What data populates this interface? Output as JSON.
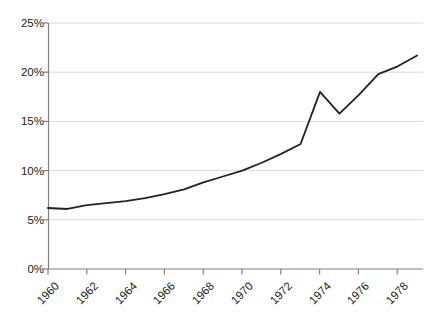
{
  "chart_data": {
    "type": "line",
    "title": "",
    "subtitle": "",
    "xlabel": "",
    "ylabel": "",
    "x": [
      1960,
      1961,
      1962,
      1963,
      1964,
      1965,
      1966,
      1967,
      1968,
      1969,
      1970,
      1971,
      1972,
      1973,
      1974,
      1975,
      1976,
      1977,
      1978,
      1979
    ],
    "values": [
      6.2,
      6.1,
      6.5,
      6.7,
      6.9,
      7.2,
      7.6,
      8.1,
      8.8,
      9.4,
      10.0,
      10.8,
      11.7,
      12.7,
      18.0,
      15.8,
      17.7,
      19.8,
      20.6,
      21.7
    ],
    "series": [
      {
        "name": "",
        "values": [
          6.2,
          6.1,
          6.5,
          6.7,
          6.9,
          7.2,
          7.6,
          8.1,
          8.8,
          9.4,
          10.0,
          10.8,
          11.7,
          12.7,
          18.0,
          15.8,
          17.7,
          19.8,
          20.6,
          21.7
        ],
        "color": "#222222"
      }
    ],
    "ylim": [
      0,
      25
    ],
    "xlim": [
      1960,
      1979.3
    ],
    "y_ticks": [
      0,
      5,
      10,
      15,
      20,
      25
    ],
    "y_tick_labels": [
      "0%",
      "5%",
      "10%",
      "15%",
      "20%",
      "25%"
    ],
    "x_ticks": [
      1960,
      1962,
      1964,
      1966,
      1968,
      1970,
      1972,
      1974,
      1976,
      1978
    ],
    "x_tick_labels": [
      "1960",
      "1962",
      "1964",
      "1966",
      "1968",
      "1970",
      "1972",
      "1974",
      "1976",
      "1978"
    ],
    "x_tick_rotation": -45,
    "grid": {
      "horizontal": true,
      "vertical": false,
      "color": "#d9d9d9"
    },
    "legend": {
      "visible": false,
      "position": "none",
      "entries": []
    },
    "axis_color": "#808080",
    "line_color": "#222222",
    "line_width": 1.8,
    "background": "#ffffff",
    "markers": false
  }
}
